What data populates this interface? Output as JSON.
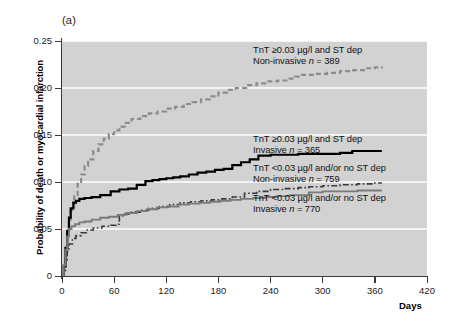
{
  "figure": {
    "panel_label": "(a)",
    "background_color": "#d2d2d2",
    "axis_color": "#3a3a3a"
  },
  "axes": {
    "ylabel": "Probability of death or myocardial infarction",
    "xlabel": "Days",
    "ytick_labels": [
      "0.25",
      "0.20",
      "0.15",
      "0.10",
      "0.05",
      "0"
    ],
    "xtick_labels": [
      "0",
      "60",
      "120",
      "180",
      "240",
      "300",
      "360",
      "420"
    ]
  },
  "legend": [
    {
      "line1": "TnT ≥0.03 µg/l and ST dep",
      "line2_prefix": "Non-invasive ",
      "line2_n": "n",
      "line2_suffix": " = 389"
    },
    {
      "line1": "TnT ≥0.03 µg/l and ST dep",
      "line2_prefix": "Invasive ",
      "line2_n": "n",
      "line2_suffix": " = 365"
    },
    {
      "line1": "TnT <0.03 µg/l and/or no ST dep",
      "line2_prefix": "Non-invasive ",
      "line2_n": "n",
      "line2_suffix": " = 759"
    },
    {
      "line1": "TnT <0.03 µg/l and/or no ST dep",
      "line2_prefix": "Invasive ",
      "line2_n": "n",
      "line2_suffix": " = 770"
    }
  ],
  "chart_data": {
    "type": "line",
    "title": "(a)",
    "subtitle": "",
    "xlabel": "Days",
    "ylabel": "Probability of death or myocardial infarction",
    "xlim": [
      0,
      420
    ],
    "ylim": [
      0,
      0.25
    ],
    "xticks": [
      0,
      60,
      120,
      180,
      240,
      300,
      360,
      420
    ],
    "yticks": [
      0,
      0.05,
      0.1,
      0.15,
      0.2,
      0.25
    ],
    "grid": "horizontal-white-gridlines",
    "legend_position": "inside-right",
    "plot_background": "#d2d2d2",
    "curve_style_note": "Kaplan-Meier style step curves",
    "series": [
      {
        "name": "TnT ≥0.03 µg/l and ST dep, Non-invasive",
        "n": 389,
        "color": "#8c8c8c",
        "dash": "dashed",
        "width": 2.2,
        "final_value": 0.223,
        "x": [
          0,
          2,
          4,
          6,
          8,
          10,
          14,
          18,
          22,
          26,
          30,
          36,
          42,
          48,
          54,
          60,
          66,
          72,
          80,
          90,
          100,
          110,
          120,
          130,
          140,
          150,
          160,
          170,
          180,
          190,
          200,
          212,
          224,
          236,
          248,
          260,
          268,
          276,
          290,
          305,
          320,
          335,
          350,
          360,
          368
        ],
        "y": [
          0.0,
          0.012,
          0.028,
          0.044,
          0.058,
          0.07,
          0.086,
          0.098,
          0.108,
          0.117,
          0.124,
          0.133,
          0.14,
          0.146,
          0.151,
          0.155,
          0.159,
          0.163,
          0.167,
          0.17,
          0.173,
          0.175,
          0.178,
          0.18,
          0.183,
          0.185,
          0.188,
          0.191,
          0.195,
          0.198,
          0.2,
          0.203,
          0.205,
          0.207,
          0.208,
          0.21,
          0.212,
          0.214,
          0.215,
          0.216,
          0.218,
          0.219,
          0.221,
          0.222,
          0.223
        ]
      },
      {
        "name": "TnT ≥0.03 µg/l and ST dep, Invasive",
        "n": 365,
        "color": "#000000",
        "dash": "solid",
        "width": 2.2,
        "final_value": 0.133,
        "x": [
          0,
          2,
          4,
          6,
          8,
          10,
          13,
          16,
          20,
          26,
          34,
          44,
          56,
          66,
          76,
          86,
          96,
          104,
          112,
          120,
          128,
          136,
          146,
          156,
          166,
          176,
          186,
          196,
          206,
          216,
          226,
          240,
          256,
          272,
          280,
          300,
          320,
          334,
          350,
          368
        ],
        "y": [
          0.0,
          0.01,
          0.03,
          0.048,
          0.062,
          0.072,
          0.078,
          0.08,
          0.082,
          0.083,
          0.084,
          0.086,
          0.09,
          0.092,
          0.093,
          0.097,
          0.101,
          0.102,
          0.103,
          0.104,
          0.105,
          0.106,
          0.108,
          0.11,
          0.111,
          0.113,
          0.114,
          0.118,
          0.121,
          0.124,
          0.128,
          0.129,
          0.129,
          0.13,
          0.13,
          0.13,
          0.131,
          0.133,
          0.133,
          0.133
        ]
      },
      {
        "name": "TnT <0.03 µg/l and/or no ST dep, Non-invasive",
        "n": 759,
        "color": "#3a3a3a",
        "dash": "dash-dot",
        "width": 1.6,
        "final_value": 0.099,
        "x": [
          0,
          2,
          4,
          6,
          8,
          12,
          16,
          22,
          28,
          36,
          46,
          56,
          62,
          66,
          72,
          80,
          90,
          100,
          112,
          124,
          136,
          148,
          160,
          172,
          184,
          196,
          210,
          224,
          240,
          256,
          272,
          284,
          300,
          320,
          340,
          360,
          368
        ],
        "y": [
          0.0,
          0.006,
          0.016,
          0.026,
          0.034,
          0.04,
          0.043,
          0.046,
          0.049,
          0.051,
          0.053,
          0.054,
          0.055,
          0.064,
          0.066,
          0.068,
          0.07,
          0.072,
          0.074,
          0.076,
          0.078,
          0.079,
          0.08,
          0.081,
          0.082,
          0.084,
          0.088,
          0.09,
          0.092,
          0.093,
          0.094,
          0.095,
          0.096,
          0.097,
          0.098,
          0.099,
          0.099
        ]
      },
      {
        "name": "TnT <0.03 µg/l and/or no ST dep, Invasive",
        "n": 770,
        "color": "#7a7a7a",
        "dash": "solid",
        "width": 1.9,
        "final_value": 0.091,
        "x": [
          0,
          2,
          4,
          6,
          8,
          11,
          15,
          20,
          26,
          34,
          44,
          54,
          64,
          74,
          86,
          98,
          110,
          122,
          134,
          146,
          158,
          170,
          182,
          194,
          206,
          220,
          234,
          248,
          262,
          276,
          284,
          300,
          320,
          340,
          360,
          368
        ],
        "y": [
          0.0,
          0.012,
          0.028,
          0.042,
          0.05,
          0.053,
          0.055,
          0.057,
          0.058,
          0.06,
          0.062,
          0.063,
          0.065,
          0.067,
          0.069,
          0.071,
          0.073,
          0.074,
          0.076,
          0.077,
          0.078,
          0.079,
          0.08,
          0.081,
          0.082,
          0.083,
          0.084,
          0.085,
          0.086,
          0.086,
          0.089,
          0.09,
          0.09,
          0.091,
          0.091,
          0.091
        ]
      }
    ]
  },
  "legend_positions": [
    {
      "left": 253,
      "top": 45
    },
    {
      "left": 253,
      "top": 134
    },
    {
      "left": 253,
      "top": 163
    },
    {
      "left": 253,
      "top": 193
    }
  ]
}
